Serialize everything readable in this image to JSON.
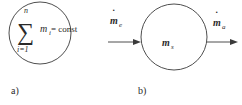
{
  "panel_a": {
    "label": "a)",
    "sum_symbol": "∑",
    "upper_limit": "n",
    "lower_limit": "i=1",
    "variable": "m",
    "subscript": "i",
    "equation_rhs": "= const"
  },
  "panel_b": {
    "label": "b)",
    "inflow": {
      "symbol": "m",
      "dot": "˙",
      "subscript": "e"
    },
    "system": {
      "symbol": "m",
      "subscript": "s"
    },
    "outflow": {
      "symbol": "m",
      "dot": "˙",
      "subscript": "a"
    }
  },
  "colors": {
    "stroke": "#3a3a3a",
    "text": "#2a2a2a",
    "background": "#ffffff"
  }
}
